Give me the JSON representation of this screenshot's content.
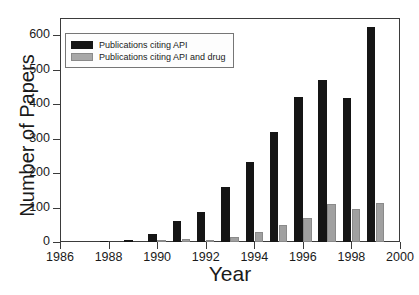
{
  "chart_data": {
    "type": "bar",
    "title": "",
    "subtitle": "",
    "xlabel": "Year",
    "ylabel": "Number of Papers",
    "xlim": [
      1986,
      2000
    ],
    "ylim": [
      0,
      650
    ],
    "yticks": [
      0,
      100,
      200,
      300,
      400,
      500,
      600
    ],
    "xticks": [
      1986,
      1988,
      1990,
      1992,
      1994,
      1996,
      1998,
      2000
    ],
    "grid": false,
    "legend_position": "upper left",
    "categories": [
      1987,
      1988,
      1989,
      1990,
      1991,
      1992,
      1993,
      1994,
      1995,
      1996,
      1997,
      1998,
      1999
    ],
    "series": [
      {
        "name": "Publications citing API",
        "color": "#151515",
        "values": [
          0,
          2,
          5,
          22,
          62,
          87,
          161,
          231,
          318,
          422,
          471,
          419,
          625
        ]
      },
      {
        "name": "Publications citing API and drug",
        "color": "#a0a0a0",
        "values": [
          0,
          0,
          0,
          2,
          9,
          7,
          16,
          30,
          48,
          70,
          111,
          95,
          114
        ]
      }
    ]
  },
  "axes": {
    "y_title": "Number of Papers",
    "x_title": "Year",
    "y_tick_labels": [
      "0",
      "100",
      "200",
      "300",
      "400",
      "500",
      "600"
    ],
    "x_tick_labels": [
      "1986",
      "1988",
      "1990",
      "1992",
      "1994",
      "1996",
      "1998",
      "2000"
    ]
  },
  "legend": {
    "entries": [
      {
        "label": "Publications citing API",
        "swatch": "black-square-swatch"
      },
      {
        "label": "Publications citing API and drug",
        "swatch": "gray-square-swatch"
      }
    ]
  }
}
